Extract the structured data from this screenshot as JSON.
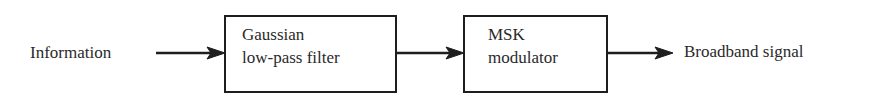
{
  "diagram": {
    "type": "block-diagram",
    "input_label": "Information",
    "blocks": [
      {
        "id": "gaussian-filter",
        "line1": "Gaussian",
        "line2": "low-pass filter"
      },
      {
        "id": "msk-modulator",
        "line1": "MSK",
        "line2": "modulator"
      }
    ],
    "output_label": "Broadband signal",
    "edges": [
      {
        "from": "Information",
        "to": "gaussian-filter"
      },
      {
        "from": "gaussian-filter",
        "to": "msk-modulator"
      },
      {
        "from": "msk-modulator",
        "to": "Broadband signal"
      }
    ],
    "colors": {
      "stroke": "#1e1e1e",
      "text": "#2a2a2a",
      "background": "#ffffff"
    }
  }
}
